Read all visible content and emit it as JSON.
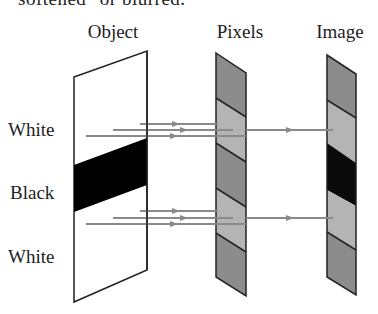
{
  "caption_fragment": "softened\" or blurred.",
  "titles": {
    "object": "Object",
    "pixels": "Pixels",
    "image": "Image"
  },
  "side_labels": {
    "top": "White",
    "middle": "Black",
    "bottom": "White"
  },
  "colors": {
    "outline": "#222222",
    "object_fill": "#ffffff",
    "object_band": "#000000",
    "pixel_dark": "#8c8c8c",
    "pixel_light": "#b4b4b4",
    "image_black": "#0a0a0a",
    "arrow": "#8a8a8a"
  }
}
